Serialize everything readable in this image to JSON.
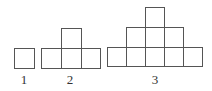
{
  "diagram": {
    "stroke_color": "#555555",
    "figures": [
      {
        "label": "1",
        "rows_bottom_up": [
          1
        ],
        "cells": [
          [
            14,
            48
          ]
        ]
      },
      {
        "label": "2",
        "rows_bottom_up": [
          3,
          1
        ],
        "cells": [
          [
            41,
            48
          ],
          [
            61,
            48
          ],
          [
            81,
            48
          ],
          [
            61,
            28
          ]
        ]
      },
      {
        "label": "3",
        "rows_bottom_up": [
          5,
          3,
          1
        ],
        "cells": [
          [
            107,
            46
          ],
          [
            126,
            46
          ],
          [
            145,
            46
          ],
          [
            164,
            46
          ],
          [
            183,
            46
          ],
          [
            126,
            27
          ],
          [
            145,
            27
          ],
          [
            164,
            27
          ],
          [
            145,
            8
          ]
        ]
      }
    ],
    "labels": [
      "1",
      "2",
      "3"
    ]
  }
}
